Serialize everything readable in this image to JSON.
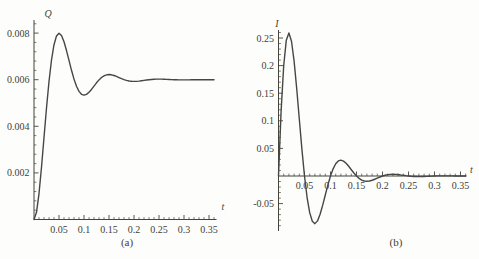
{
  "figure": {
    "background": "#fdfdfb",
    "axis_color": "#45453c",
    "text_color": "#3f3f38",
    "curve_color": "#464646"
  },
  "chart_data": [
    {
      "id": "a",
      "type": "line",
      "caption": "(a)",
      "xlabel": "t",
      "ylabel": "Q",
      "xlim": [
        0,
        0.365
      ],
      "ylim": [
        0,
        0.0086
      ],
      "grid": "off",
      "legend": "none",
      "x_major_ticks": [
        0.05,
        0.1,
        0.15,
        0.2,
        0.25,
        0.3,
        0.35
      ],
      "x_tick_labels": [
        "0.05",
        "0.1",
        "0.15",
        "0.2",
        "0.25",
        "0.3",
        "0.35"
      ],
      "x_minor_step": 0.01,
      "y_major_ticks": [
        0.002,
        0.004,
        0.006,
        0.008
      ],
      "y_tick_labels": [
        "0.002",
        "0.004",
        "0.006",
        "0.008"
      ],
      "y_minor_step": 0.0004,
      "steady_state_value": 0.006,
      "peak_value": 0.008,
      "series": [
        {
          "name": "Q(t)",
          "t_start": 0,
          "t_step": 0.005,
          "values": [
            0,
            0.000307,
            0.001114,
            0.002243,
            0.003519,
            0.004788,
            0.005925,
            0.006846,
            0.007501,
            0.007879,
            0.007997,
            0.007895,
            0.007627,
            0.007251,
            0.006826,
            0.006403,
            0.006025,
            0.005719,
            0.0055,
            0.005374,
            0.005335,
            0.005369,
            0.005459,
            0.005583,
            0.005725,
            0.005866,
            0.005992,
            0.006094,
            0.006166,
            0.006208,
            0.006221,
            0.00621,
            0.00618,
            0.006139,
            0.006091,
            0.006045,
            0.006003,
            0.005969,
            0.005945,
            0.005931,
            0.005926,
            0.00593,
            0.00594,
            0.005954,
            0.00597,
            0.005985,
            0.005999,
            0.00601,
            0.006018,
            0.006023,
            0.006025,
            0.006023,
            0.00602,
            0.006015,
            0.00601,
            0.006005,
            0.006,
            0.005997,
            0.005994,
            0.005992,
            0.005992,
            0.005993,
            0.005994,
            0.005996,
            0.005997,
            0.005999,
            0.006,
            0.006001,
            0.006001,
            0.006001,
            0.006001,
            0.006,
            0.006
          ]
        }
      ]
    },
    {
      "id": "b",
      "type": "line",
      "caption": "(b)",
      "xlabel": "t",
      "ylabel": "I",
      "xlim": [
        0,
        0.365
      ],
      "ylim": [
        -0.1,
        0.265
      ],
      "grid": "off",
      "legend": "none",
      "x_major_ticks": [
        0.05,
        0.1,
        0.15,
        0.2,
        0.25,
        0.3,
        0.35
      ],
      "x_tick_labels": [
        "0.05",
        "0.1",
        "0.15",
        "0.2",
        "0.25",
        "0.3",
        "0.35"
      ],
      "x_minor_step": 0.01,
      "y_major_ticks": [
        -0.05,
        0.05,
        0.1,
        0.15,
        0.2,
        0.25
      ],
      "y_tick_labels": [
        "-0.05",
        "0.05",
        "0.1",
        "0.15",
        "0.2",
        "0.25"
      ],
      "y_minor_step": 0.01,
      "peak_value": 0.25,
      "series": [
        {
          "name": "I(t)",
          "t_start": 0,
          "t_step": 0.005,
          "values": [
            0,
            0.1171,
            0.1997,
            0.2461,
            0.2592,
            0.2441,
            0.2081,
            0.1585,
            0.1032,
            0.0486,
            0,
            -0.039,
            -0.0664,
            -0.0819,
            -0.0863,
            -0.0813,
            -0.0692,
            -0.0528,
            -0.0344,
            -0.0162,
            0,
            0.013,
            0.0221,
            0.0273,
            0.0287,
            0.027,
            0.0231,
            0.0176,
            0.0114,
            0.0054,
            0,
            -0.0043,
            -0.0074,
            -0.0091,
            -0.0095,
            -0.009,
            -0.0077,
            -0.0059,
            -0.0038,
            -0.0018,
            0,
            0.0014,
            0.0025,
            0.003,
            0.0032,
            0.003,
            0.0026,
            0.0019,
            0.0013,
            0.0006,
            0,
            -0.0005,
            -0.0008,
            -0.001,
            -0.0011,
            -0.001,
            -0.0008,
            -0.0006,
            -0.0004,
            -0.0002,
            0,
            0.0002,
            0.0003,
            0.0003,
            0.0003,
            0.0003,
            0.0003,
            0.0002,
            0.0001,
            0.0001,
            0,
            0,
            0
          ]
        }
      ]
    }
  ]
}
